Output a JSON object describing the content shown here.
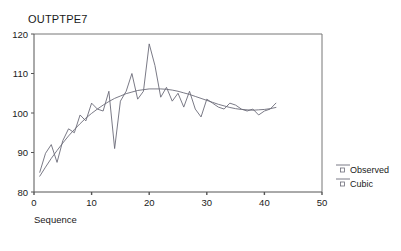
{
  "chart": {
    "title": "OUTPTPE7",
    "xlabel": "Sequence",
    "ylabel": ""
  },
  "axes": {
    "y_ticks": [
      "120",
      "110",
      "100",
      "90",
      "80"
    ],
    "x_ticks": [
      "0",
      "10",
      "20",
      "30",
      "40",
      "50"
    ]
  },
  "legend": {
    "items": [
      {
        "label": "Observed",
        "marker": "small-square-marker"
      },
      {
        "label": "Cubic",
        "marker": "small-square-marker"
      }
    ]
  },
  "chart_data": {
    "type": "line",
    "title": "OUTPTPE7",
    "xlabel": "Sequence",
    "ylabel": "",
    "xlim": [
      0,
      50
    ],
    "ylim": [
      80,
      120
    ],
    "grid": false,
    "legend_position": "right",
    "x": [
      1,
      2,
      3,
      4,
      5,
      6,
      7,
      8,
      9,
      10,
      11,
      12,
      13,
      14,
      15,
      16,
      17,
      18,
      19,
      20,
      21,
      22,
      23,
      24,
      25,
      26,
      27,
      28,
      29,
      30,
      31,
      32,
      33,
      34,
      35,
      36,
      37,
      38,
      39,
      40,
      41,
      42
    ],
    "series": [
      {
        "name": "Observed",
        "values": [
          85.0,
          89.8,
          92.0,
          87.5,
          93.0,
          96.0,
          95.0,
          99.5,
          98.0,
          102.5,
          101.0,
          100.5,
          105.5,
          91.0,
          103.0,
          105.5,
          110.0,
          103.5,
          105.5,
          117.5,
          112.0,
          104.0,
          106.5,
          103.0,
          105.0,
          101.5,
          105.5,
          101.0,
          99.0,
          103.5,
          102.5,
          101.5,
          101.0,
          102.5,
          102.0,
          101.0,
          100.5,
          101.0,
          99.5,
          100.5,
          101.0,
          102.5
        ]
      },
      {
        "name": "Cubic",
        "values": [
          84.0,
          86.3,
          88.5,
          90.5,
          92.4,
          94.2,
          95.8,
          97.3,
          98.7,
          99.9,
          101.0,
          102.0,
          102.9,
          103.7,
          104.3,
          104.9,
          105.3,
          105.7,
          105.9,
          106.1,
          106.1,
          106.1,
          106.0,
          105.8,
          105.5,
          105.1,
          104.7,
          104.2,
          103.7,
          103.2,
          102.7,
          102.2,
          101.8,
          101.4,
          101.1,
          100.9,
          100.8,
          100.7,
          100.8,
          100.9,
          101.1,
          101.4
        ]
      }
    ]
  }
}
